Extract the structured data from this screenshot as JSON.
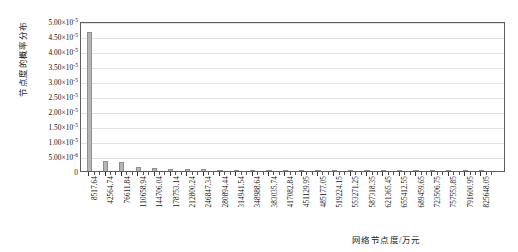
{
  "chart_data": {
    "type": "bar",
    "title": "",
    "subtitle": "",
    "xlabel": "网络节点度/万元",
    "ylabel": "节点度的概率分布",
    "ylim": [
      0,
      5e-05
    ],
    "ytick_values": [
      0,
      5e-06,
      1e-05,
      1.5e-05,
      2e-05,
      2.5e-05,
      3e-05,
      3.5e-05,
      4e-05,
      4.5e-05,
      5e-05
    ],
    "ytick_labels": [
      {
        "mantissa": "0",
        "exponent": "",
        "display": "0"
      },
      {
        "mantissa": "5.00×10",
        "exponent": "-6",
        "display": "5.00×10^-6"
      },
      {
        "mantissa": "1.00×10",
        "exponent": "-5",
        "display": "1.00×10^-5"
      },
      {
        "mantissa": "1.50×10",
        "exponent": "-5",
        "display": "1.50×10^-5"
      },
      {
        "mantissa": "2.00×10",
        "exponent": "-5",
        "display": "2.00×10^-5"
      },
      {
        "mantissa": "2.50×10",
        "exponent": "-5",
        "display": "2.50×10^-5"
      },
      {
        "mantissa": "3.00×10",
        "exponent": "-5",
        "display": "3.00×10^-5"
      },
      {
        "mantissa": "3.50×10",
        "exponent": "-5",
        "display": "3.50×10^-5"
      },
      {
        "mantissa": "4.00×10",
        "exponent": "-5",
        "display": "4.00×10^-5"
      },
      {
        "mantissa": "4.50×10",
        "exponent": "-5",
        "display": "4.50×10^-5"
      },
      {
        "mantissa": "5.00×10",
        "exponent": "-5",
        "display": "5.00×10^-5"
      }
    ],
    "categories": [
      "8517.64",
      "42564.74",
      "76611.84",
      "110658.94",
      "144706.04",
      "178753.14",
      "212800.24",
      "246847.34",
      "280894.44",
      "314941.54",
      "348988.64",
      "383035.74",
      "417082.84",
      "451129.95",
      "485177.05",
      "519224.15",
      "553271.25",
      "587318.35",
      "621365.45",
      "655412.55",
      "689459.65",
      "723506.75",
      "757553.85",
      "791600.95",
      "825648.05"
    ],
    "values": [
      4.62e-05,
      3.2e-06,
      3e-06,
      1.2e-06,
      1.1e-06,
      8e-07,
      7e-07,
      6e-07,
      5e-07,
      4e-07,
      4e-07,
      3e-07,
      3e-07,
      3e-07,
      2e-07,
      2e-07,
      2e-07,
      2e-07,
      2e-07,
      1e-07,
      1e-07,
      1e-07,
      1e-07,
      1e-07,
      1e-07
    ],
    "grid": true,
    "legend": null,
    "bar_color": "#b6b6b6",
    "bar_edge_color": "#8e8e8e",
    "axis_color": "#5d5d5d",
    "grid_color": "#e2e2e2",
    "n_minor_ticks_per_major": 2
  }
}
